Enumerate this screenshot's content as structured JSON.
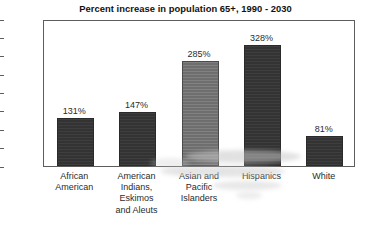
{
  "chart_data": {
    "type": "bar",
    "title": "Percent increase in population 65+, 1990 - 2030",
    "xlabel": "",
    "ylabel": "",
    "ylim": [
      0,
      400
    ],
    "ytick_step": 50,
    "grid": false,
    "legend": "none",
    "yticks": [
      "400",
      "350",
      "300",
      "250",
      "200",
      "150",
      "100",
      "50",
      "0"
    ],
    "categories": [
      "African American",
      "American Indians, Eskimos and Aleuts",
      "Asian and Pacific Islanders",
      "Hispanics",
      "White"
    ],
    "category_lines": [
      [
        "African",
        "American"
      ],
      [
        "American",
        "Indians,",
        "Eskimos",
        "and Aleuts"
      ],
      [
        "Asian and",
        "Pacific",
        "Islanders"
      ],
      [
        "Hispanics"
      ],
      [
        "White"
      ]
    ],
    "values": [
      131,
      147,
      285,
      328,
      81
    ],
    "value_labels": [
      "131%",
      "147%",
      "285%",
      "328%",
      "81%"
    ],
    "bar_colors": [
      "#333333",
      "#333333",
      "#6e6e6e",
      "#333333",
      "#333333"
    ]
  },
  "colors": {
    "background": "#ffffff",
    "axis": "#5d5d5d",
    "text": "#2b2b2b",
    "title": "#111111",
    "bar_dark": "#333333",
    "bar_gray": "#6e6e6e"
  }
}
